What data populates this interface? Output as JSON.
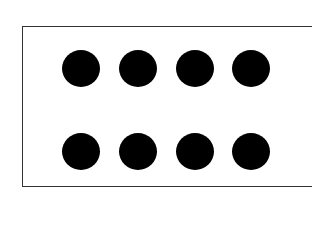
{
  "diagram": {
    "rows": 2,
    "columns": 4,
    "dot_color": "#000000",
    "border_color": "#333333",
    "background_color": "#ffffff",
    "dots": [
      {
        "row": 1,
        "col": 1,
        "cx": 81,
        "cy": 68
      },
      {
        "row": 1,
        "col": 2,
        "cx": 138,
        "cy": 68
      },
      {
        "row": 1,
        "col": 3,
        "cx": 195,
        "cy": 68
      },
      {
        "row": 1,
        "col": 4,
        "cx": 251,
        "cy": 68
      },
      {
        "row": 2,
        "col": 1,
        "cx": 81,
        "cy": 151
      },
      {
        "row": 2,
        "col": 2,
        "cx": 138,
        "cy": 151
      },
      {
        "row": 2,
        "col": 3,
        "cx": 195,
        "cy": 151
      },
      {
        "row": 2,
        "col": 4,
        "cx": 251,
        "cy": 151
      }
    ]
  }
}
